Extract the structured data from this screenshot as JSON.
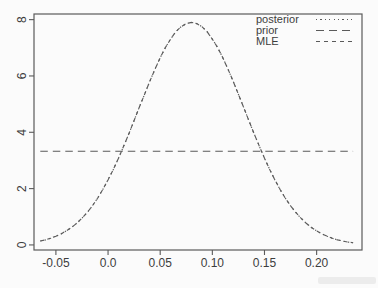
{
  "figure": {
    "background": "#fbfbfb",
    "line_color": "#5a5a5a",
    "text_color": "#3d3d3d"
  },
  "chart_data": {
    "type": "line",
    "title": "",
    "xlabel": "",
    "ylabel": "",
    "grid": false,
    "legend_position": "top-right",
    "xlim": [
      -0.071,
      0.2435
    ],
    "ylim": [
      -0.18,
      8.2
    ],
    "x_ticks": [
      -0.05,
      0.0,
      0.05,
      0.1,
      0.15,
      0.2
    ],
    "x_tick_labels": [
      "-0.05",
      "0.0",
      "0.05",
      "0.10",
      "0.15",
      "0.20"
    ],
    "y_ticks": [
      0,
      2,
      4,
      6,
      8
    ],
    "y_tick_labels": [
      "0",
      "2",
      "4",
      "6",
      "8"
    ],
    "x": [
      -0.065,
      -0.06,
      -0.055,
      -0.05,
      -0.045,
      -0.04,
      -0.035,
      -0.03,
      -0.025,
      -0.02,
      -0.015,
      -0.01,
      -0.005,
      0,
      0.005,
      0.01,
      0.015,
      0.02,
      0.025,
      0.03,
      0.035,
      0.04,
      0.045,
      0.05,
      0.055,
      0.06,
      0.065,
      0.07,
      0.075,
      0.08,
      0.085,
      0.09,
      0.095,
      0.1,
      0.105,
      0.11,
      0.115,
      0.12,
      0.125,
      0.13,
      0.135,
      0.14,
      0.145,
      0.15,
      0.155,
      0.16,
      0.165,
      0.17,
      0.175,
      0.18,
      0.185,
      0.19,
      0.195,
      0.2,
      0.205,
      0.21,
      0.215,
      0.22,
      0.225,
      0.23,
      0.235
    ],
    "series": [
      {
        "name": "posterior",
        "style": "dotted",
        "peak": 7.9,
        "peak_x": 0.08,
        "values": [
          0.14,
          0.18,
          0.24,
          0.31,
          0.39,
          0.5,
          0.62,
          0.77,
          0.95,
          1.15,
          1.39,
          1.66,
          1.97,
          2.31,
          2.68,
          3.08,
          3.51,
          3.95,
          4.42,
          4.89,
          5.35,
          5.81,
          6.24,
          6.65,
          7.01,
          7.31,
          7.57,
          7.75,
          7.86,
          7.9,
          7.86,
          7.75,
          7.57,
          7.31,
          7.01,
          6.65,
          6.24,
          5.81,
          5.35,
          4.89,
          4.42,
          3.95,
          3.51,
          3.08,
          2.68,
          2.31,
          1.97,
          1.66,
          1.39,
          1.15,
          0.95,
          0.77,
          0.62,
          0.5,
          0.39,
          0.31,
          0.24,
          0.18,
          0.14,
          0.1,
          0.08
        ]
      },
      {
        "name": "prior",
        "style": "longdash",
        "constant": 3.33
      },
      {
        "name": "MLE",
        "style": "shortdash",
        "peak": 7.9,
        "peak_x": 0.08,
        "values": [
          0.14,
          0.18,
          0.24,
          0.31,
          0.39,
          0.5,
          0.62,
          0.77,
          0.95,
          1.15,
          1.39,
          1.66,
          1.97,
          2.31,
          2.68,
          3.08,
          3.51,
          3.95,
          4.42,
          4.89,
          5.35,
          5.81,
          6.24,
          6.65,
          7.01,
          7.31,
          7.57,
          7.75,
          7.86,
          7.9,
          7.86,
          7.75,
          7.57,
          7.31,
          7.01,
          6.65,
          6.24,
          5.81,
          5.35,
          4.89,
          4.42,
          3.95,
          3.51,
          3.08,
          2.68,
          2.31,
          1.97,
          1.66,
          1.39,
          1.15,
          0.95,
          0.77,
          0.62,
          0.5,
          0.39,
          0.31,
          0.24,
          0.18,
          0.14,
          0.1,
          0.08
        ]
      }
    ]
  }
}
